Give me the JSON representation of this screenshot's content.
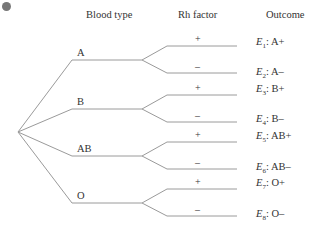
{
  "headers": {
    "blood_type": "Blood type",
    "rh_factor": "Rh factor",
    "outcome": "Outcome"
  },
  "blood_types": [
    {
      "label": "A",
      "y": 60
    },
    {
      "label": "B",
      "y": 109
    },
    {
      "label": "AB",
      "y": 156
    },
    {
      "label": "O",
      "y": 203
    }
  ],
  "rh_signs": {
    "positive": "+",
    "negative": "–"
  },
  "outcomes": [
    {
      "event": "E",
      "sub": "1",
      "text": ": A+"
    },
    {
      "event": "E",
      "sub": "2",
      "text": ": A–"
    },
    {
      "event": "E",
      "sub": "3",
      "text": ": B+"
    },
    {
      "event": "E",
      "sub": "4",
      "text": ": B–"
    },
    {
      "event": "E",
      "sub": "5",
      "text": ": AB+"
    },
    {
      "event": "E",
      "sub": "6",
      "text": ": AB–"
    },
    {
      "event": "E",
      "sub": "7",
      "text": ": O+"
    },
    {
      "event": "E",
      "sub": "8",
      "text": ": O–"
    }
  ],
  "colors": {
    "line": "#9a9a9a",
    "text": "#333333",
    "dot": "#777777"
  }
}
